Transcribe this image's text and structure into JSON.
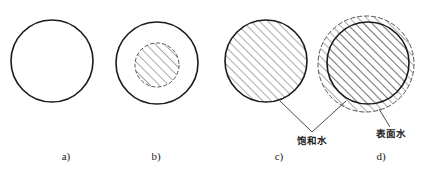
{
  "figure": {
    "background": "#ffffff",
    "stroke_color": "#1a1a1a",
    "hatch_color": "#555555",
    "panels": [
      {
        "id": "a",
        "caption": "a)",
        "caption_pos": [
          66,
          160
        ],
        "description": "empty solid circle",
        "outer_circle": {
          "cx": 52,
          "cy": 61,
          "r": 41,
          "style": "solid",
          "hatched": false
        }
      },
      {
        "id": "b",
        "caption": "b)",
        "caption_pos": [
          156,
          160
        ],
        "description": "solid circle with small dashed hatched core",
        "outer_circle": {
          "cx": 157,
          "cy": 63,
          "r": 41,
          "style": "solid",
          "hatched": false
        },
        "inner_circle": {
          "cx": 157,
          "cy": 65,
          "r": 22,
          "style": "dashed",
          "hatched": true
        }
      },
      {
        "id": "c",
        "caption": "c)",
        "caption_pos": [
          279,
          160
        ],
        "description": "fully hatched solid circle",
        "outer_circle": {
          "cx": 266,
          "cy": 61,
          "r": 41,
          "style": "solid",
          "hatched": true
        }
      },
      {
        "id": "d",
        "caption": "d)",
        "caption_pos": [
          381,
          160
        ],
        "description": "hatched solid circle surrounded by dashed hatched ring",
        "outer_ring": {
          "cx": 366,
          "cy": 64,
          "r": 48,
          "style": "dashed",
          "hatched": true
        },
        "outer_circle": {
          "cx": 368,
          "cy": 63,
          "r": 41,
          "style": "solid",
          "hatched": true
        }
      }
    ],
    "annotations": {
      "saturated_water": {
        "text": "饱和水",
        "text_pos": [
          312,
          144
        ],
        "leaders": [
          {
            "from": [
              280,
              101
            ],
            "to": [
              312,
              132
            ]
          },
          {
            "from": [
              346,
              101
            ],
            "to": [
              312,
              132
            ]
          }
        ]
      },
      "surface_water": {
        "text": "表面水",
        "text_pos": [
          391,
          137
        ],
        "leaders": [
          {
            "from": [
              379,
              109
            ],
            "to": [
              390,
              127
            ]
          }
        ]
      }
    }
  }
}
